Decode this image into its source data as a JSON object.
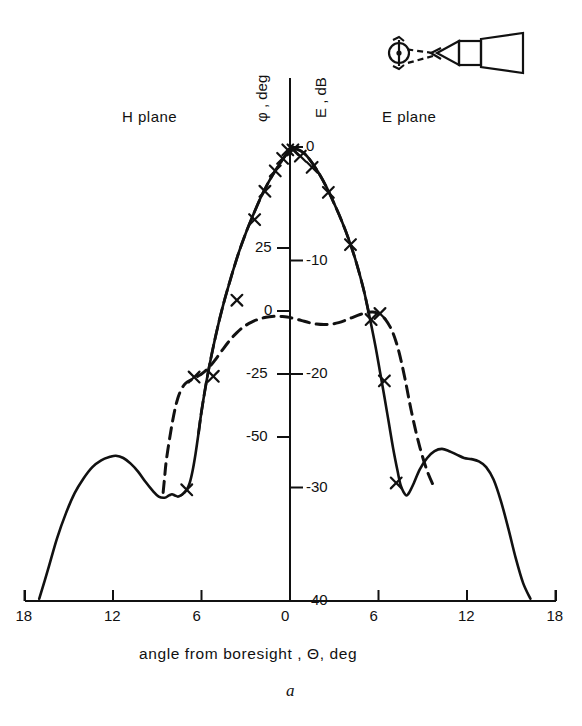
{
  "figure": {
    "caption": "a",
    "plane_left_label": "H plane",
    "plane_right_label": "E plane",
    "xaxis_title": "angle  from  boresight , Θ, deg",
    "yaxis_left_title": "φ , deg",
    "yaxis_right_title": "E , dB",
    "icon_name": "horn-antenna-with-rotating-source"
  },
  "chart_data": {
    "type": "line",
    "title": "",
    "subtitle": "",
    "xlabel": "angle from boresight, Θ, deg",
    "ylabel_left": "φ, deg",
    "ylabel_right": "E, dB",
    "grid": false,
    "legend_position": "none",
    "xlim": [
      -18,
      18
    ],
    "xticks": [
      -18,
      -12,
      -6,
      0,
      6,
      12,
      18
    ],
    "xticklabels": [
      "18",
      "12",
      "6",
      "0",
      "6",
      "12",
      "18"
    ],
    "ylim_right_dB": [
      -40,
      2
    ],
    "yticks_right_dB": [
      0,
      -10,
      -20,
      -30,
      -40
    ],
    "yticklabels_right": [
      "0",
      "-10",
      "-20",
      "-30",
      "-40"
    ],
    "ylim_left_deg": [
      -63,
      38
    ],
    "yticks_left_deg": [
      25,
      0,
      -25,
      -50
    ],
    "yticklabels_left": [
      "25",
      "0",
      "-25",
      "-50"
    ],
    "annotations": [
      {
        "text": "H plane",
        "x": -11.5,
        "y_dB": 1.5
      },
      {
        "text": "E plane",
        "x": 9.5,
        "y_dB": 1.5
      }
    ],
    "series": [
      {
        "name": "amplitude-pattern-E-dB",
        "style": "solid",
        "axis": "right",
        "units": "dB",
        "x": [
          -17.0,
          -16.4,
          -15.8,
          -15.2,
          -14.6,
          -14.0,
          -13.4,
          -12.8,
          -12.2,
          -11.8,
          -11.3,
          -10.8,
          -10.3,
          -9.8,
          -9.3,
          -8.9,
          -8.5,
          -8.2,
          -8.0,
          -7.8,
          -7.6,
          -7.4,
          -7.2,
          -7.0,
          -6.8,
          -6.6,
          -6.4,
          -6.2,
          -6.0,
          -5.6,
          -5.2,
          -4.8,
          -4.4,
          -4.0,
          -3.5,
          -3.0,
          -2.5,
          -2.0,
          -1.5,
          -1.0,
          -0.5,
          0.0,
          0.5,
          1.0,
          1.5,
          2.0,
          2.5,
          3.0,
          3.5,
          4.0,
          4.5,
          5.0,
          5.4,
          5.8,
          6.1,
          6.4,
          6.7,
          7.0,
          7.3,
          7.5,
          7.7,
          7.9,
          8.1,
          8.4,
          8.8,
          9.3,
          9.8,
          10.3,
          10.8,
          11.3,
          11.8,
          12.3,
          12.8,
          13.3,
          13.8,
          14.3,
          14.8,
          15.3,
          15.8,
          16.3
        ],
        "values": [
          -39.8,
          -37.2,
          -34.5,
          -32.3,
          -30.5,
          -29.2,
          -28.2,
          -27.6,
          -27.3,
          -27.2,
          -27.4,
          -27.9,
          -28.6,
          -29.5,
          -30.3,
          -30.8,
          -30.9,
          -30.7,
          -30.6,
          -30.7,
          -30.8,
          -30.7,
          -30.5,
          -30.2,
          -29.6,
          -28.5,
          -27.0,
          -25.2,
          -23.3,
          -20.2,
          -17.6,
          -15.3,
          -13.3,
          -11.5,
          -9.4,
          -7.6,
          -6.0,
          -4.5,
          -3.2,
          -2.1,
          -1.1,
          -0.3,
          -0.2,
          -0.6,
          -1.4,
          -2.4,
          -3.6,
          -5.0,
          -6.5,
          -8.2,
          -10.2,
          -12.6,
          -15.0,
          -17.6,
          -19.8,
          -22.0,
          -24.3,
          -26.6,
          -28.6,
          -29.8,
          -30.4,
          -30.7,
          -30.4,
          -29.6,
          -28.4,
          -27.4,
          -26.8,
          -26.6,
          -26.8,
          -27.1,
          -27.4,
          -27.5,
          -27.7,
          -28.2,
          -29.3,
          -31.2,
          -33.6,
          -36.2,
          -38.4,
          -39.8
        ]
      },
      {
        "name": "phase-pattern-phi-deg",
        "style": "dashed",
        "axis": "left",
        "units": "deg",
        "x": [
          -8.6,
          -8.5,
          -8.4,
          -8.2,
          -8.0,
          -7.8,
          -7.6,
          -7.4,
          -7.2,
          -7.0,
          -6.8,
          -6.6,
          -6.4,
          -6.2,
          -6.0,
          -5.7,
          -5.4,
          -5.1,
          -4.8,
          -4.5,
          -4.2,
          -3.9,
          -3.6,
          -3.3,
          -3.0,
          -2.6,
          -2.2,
          -1.8,
          -1.4,
          -1.0,
          -0.6,
          -0.2,
          0.3,
          0.8,
          1.3,
          1.8,
          2.3,
          2.8,
          3.3,
          3.8,
          4.3,
          4.8,
          5.2,
          5.6,
          5.9,
          6.2,
          6.5,
          6.8,
          7.0,
          7.2,
          7.4,
          7.6,
          7.8,
          8.0,
          8.2,
          8.5,
          8.8,
          9.1,
          9.4,
          9.7
        ],
        "values": [
          -72.0,
          -66.0,
          -60.0,
          -52.0,
          -45.0,
          -39.0,
          -34.5,
          -31.5,
          -29.5,
          -28.3,
          -27.6,
          -27.0,
          -26.4,
          -25.7,
          -25.0,
          -23.6,
          -21.8,
          -19.6,
          -17.2,
          -14.8,
          -12.5,
          -10.4,
          -8.6,
          -7.0,
          -5.7,
          -4.4,
          -3.4,
          -2.7,
          -2.3,
          -2.1,
          -2.2,
          -2.4,
          -3.0,
          -3.8,
          -4.6,
          -5.2,
          -5.4,
          -5.2,
          -4.6,
          -3.6,
          -2.4,
          -1.3,
          -0.6,
          -0.4,
          -0.8,
          -1.8,
          -3.6,
          -6.4,
          -9.0,
          -12.4,
          -16.5,
          -21.5,
          -27.0,
          -33.0,
          -39.0,
          -47.0,
          -54.0,
          -60.0,
          -65.0,
          -69.0
        ]
      }
    ],
    "markers": {
      "name": "measured-points",
      "symbol": "x",
      "axis": "right",
      "points": [
        {
          "x": -7.0,
          "y_dB": -30.2
        },
        {
          "x": -5.2,
          "y_dB": -20.2
        },
        {
          "x": -3.6,
          "y_dB": -13.5
        },
        {
          "x": -2.4,
          "y_dB": -6.4
        },
        {
          "x": -1.7,
          "y_dB": -3.9
        },
        {
          "x": -1.0,
          "y_dB": -2.1
        },
        {
          "x": -0.5,
          "y_dB": -1.0
        },
        {
          "x": -0.15,
          "y_dB": -0.25
        },
        {
          "x": 0.2,
          "y_dB": -0.25
        },
        {
          "x": 0.7,
          "y_dB": -0.8
        },
        {
          "x": 1.5,
          "y_dB": -1.8
        },
        {
          "x": 2.6,
          "y_dB": -4.0
        },
        {
          "x": 4.1,
          "y_dB": -8.6
        },
        {
          "x": 5.5,
          "y_dB": -15.2
        },
        {
          "x": 6.4,
          "y_dB": -20.6
        },
        {
          "x": 7.2,
          "y_dB": -29.6
        }
      ]
    },
    "phase_markers": {
      "name": "measured-phase-points",
      "symbol": "x",
      "axis": "left",
      "points": [
        {
          "x": -6.5,
          "y_deg": -26.2
        },
        {
          "x": 6.1,
          "y_deg": -1.0
        }
      ]
    }
  }
}
